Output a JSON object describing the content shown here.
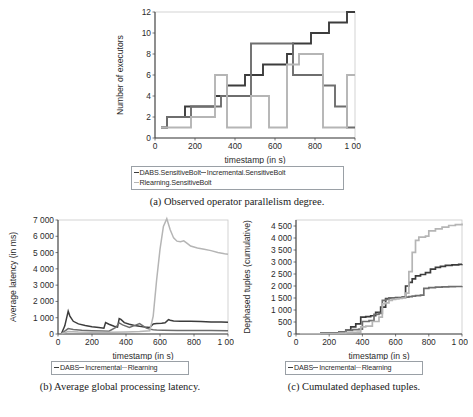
{
  "figure": {
    "panels": [
      {
        "id": "a",
        "caption": "(a) Observed operator parallelism degree.",
        "legend": [
          {
            "label": "DABS.SensitiveBolt",
            "color": "#3c3c3c"
          },
          {
            "label": "Incremental.SensitiveBolt",
            "color": "#6e6e6e"
          },
          {
            "label": "Rlearning.SensitiveBolt",
            "color": "#b5b5b5"
          }
        ]
      },
      {
        "id": "b",
        "caption": "(b) Average global processing latency.",
        "legend": [
          {
            "label": "DABS",
            "color": "#3c3c3c"
          },
          {
            "label": "Incremental",
            "color": "#6e6e6e"
          },
          {
            "label": "Rlearning",
            "color": "#b5b5b5"
          }
        ]
      },
      {
        "id": "c",
        "caption": "(c) Cumulated dephased tuples.",
        "legend": [
          {
            "label": "DABS",
            "color": "#3c3c3c"
          },
          {
            "label": "Incremental",
            "color": "#6e6e6e"
          },
          {
            "label": "Rlearning",
            "color": "#b5b5b5"
          }
        ]
      }
    ]
  },
  "chart_data": [
    {
      "id": "a",
      "type": "line",
      "title": "",
      "xlabel": "timestamp (in s)",
      "ylabel": "Number of executors",
      "xlim": [
        0,
        1000
      ],
      "ylim": [
        0,
        12
      ],
      "xticks": [
        0,
        200,
        400,
        600,
        800,
        1000
      ],
      "xticklabels": [
        "0",
        "200",
        "400",
        "600",
        "800",
        "1 000"
      ],
      "yticks": [
        0,
        2,
        4,
        6,
        8,
        10,
        12
      ],
      "yticklabels": [
        "0",
        "2",
        "4",
        "6",
        "8",
        "10",
        "12"
      ],
      "grid": false,
      "legend_position": "below",
      "step": true,
      "series": [
        {
          "name": "DABS.SensitiveBolt",
          "color": "#3c3c3c",
          "x": [
            30,
            60,
            120,
            150,
            270,
            300,
            330,
            360,
            420,
            450,
            480,
            540,
            600,
            660,
            690,
            720,
            750,
            780,
            810,
            840,
            870,
            900,
            930,
            960,
            990,
            1000
          ],
          "y": [
            1,
            2,
            2,
            3,
            3,
            4,
            4,
            5,
            5,
            6,
            6,
            7,
            7,
            8,
            9,
            9,
            9,
            10,
            10,
            10,
            11,
            11,
            11,
            12,
            12,
            12
          ]
        },
        {
          "name": "Incremental.SensitiveBolt",
          "color": "#6e6e6e",
          "x": [
            30,
            60,
            150,
            180,
            300,
            330,
            360,
            450,
            480,
            540,
            570,
            660,
            690,
            720,
            780,
            810,
            840,
            870,
            900,
            930,
            960,
            1000
          ],
          "y": [
            1,
            2,
            2,
            3,
            3,
            4,
            4,
            4,
            9,
            9,
            9,
            9,
            6,
            6,
            6,
            6,
            5,
            5,
            3,
            3,
            1,
            1
          ]
        },
        {
          "name": "Rlearning.SensitiveBolt",
          "color": "#b5b5b5",
          "x": [
            30,
            150,
            180,
            270,
            300,
            330,
            360,
            450,
            480,
            540,
            570,
            630,
            660,
            690,
            720,
            750,
            810,
            840,
            870,
            900,
            930,
            960,
            1000
          ],
          "y": [
            1,
            1,
            2,
            2,
            6,
            6,
            1,
            1,
            4,
            4,
            1,
            1,
            7,
            7,
            8,
            8,
            8,
            1,
            1,
            1,
            1,
            6,
            6
          ]
        }
      ]
    },
    {
      "id": "b",
      "type": "line",
      "title": "",
      "xlabel": "timestamp (in s)",
      "ylabel": "Average latency (in ms)",
      "xlim": [
        0,
        1000
      ],
      "ylim": [
        0,
        7000
      ],
      "xticks": [
        0,
        200,
        400,
        600,
        800,
        1000
      ],
      "xticklabels": [
        "0",
        "200",
        "400",
        "600",
        "800",
        "1 000"
      ],
      "yticks": [
        0,
        1000,
        2000,
        3000,
        4000,
        5000,
        6000,
        7000
      ],
      "yticklabels": [
        "0",
        "1 000",
        "2 000",
        "3 000",
        "4 000",
        "5 000",
        "6 000",
        "7 000"
      ],
      "grid": false,
      "legend_position": "below",
      "series": [
        {
          "name": "DABS",
          "color": "#3c3c3c",
          "x": [
            20,
            40,
            60,
            70,
            90,
            120,
            160,
            200,
            240,
            270,
            280,
            300,
            330,
            350,
            360,
            370,
            390,
            420,
            450,
            480,
            510,
            540,
            560,
            580,
            610,
            630,
            650,
            660,
            680,
            720,
            780,
            840,
            900,
            960,
            1000
          ],
          "y": [
            20,
            500,
            1400,
            1100,
            780,
            620,
            520,
            450,
            400,
            360,
            700,
            600,
            480,
            420,
            950,
            900,
            700,
            600,
            520,
            470,
            430,
            400,
            620,
            640,
            660,
            690,
            880,
            840,
            800,
            790,
            780,
            760,
            740,
            730,
            720
          ]
        },
        {
          "name": "Incremental",
          "color": "#6e6e6e",
          "x": [
            20,
            60,
            90,
            140,
            200,
            260,
            300,
            340,
            360,
            380,
            420,
            460,
            480,
            500,
            520,
            540,
            560,
            580,
            620,
            700,
            800,
            900,
            1000
          ],
          "y": [
            20,
            330,
            280,
            230,
            200,
            180,
            170,
            400,
            680,
            560,
            400,
            560,
            640,
            500,
            360,
            300,
            260,
            240,
            230,
            220,
            215,
            210,
            205
          ]
        },
        {
          "name": "Rlearning",
          "color": "#b5b5b5",
          "x": [
            20,
            60,
            120,
            200,
            300,
            400,
            480,
            540,
            560,
            580,
            600,
            620,
            640,
            660,
            680,
            700,
            720,
            740,
            760,
            780,
            820,
            860,
            900,
            940,
            980,
            1000
          ],
          "y": [
            20,
            150,
            120,
            110,
            110,
            130,
            160,
            200,
            1100,
            3300,
            5200,
            6600,
            7080,
            6400,
            5900,
            5700,
            5660,
            5720,
            5560,
            5400,
            5280,
            5200,
            5120,
            5000,
            4930,
            4900
          ]
        }
      ]
    },
    {
      "id": "c",
      "type": "line",
      "title": "",
      "xlabel": "timestamp (in s)",
      "ylabel": "Dephased tuples (cumulative)",
      "xlim": [
        0,
        1000
      ],
      "ylim": [
        0,
        4750
      ],
      "xticks": [
        0,
        200,
        400,
        600,
        800,
        1000
      ],
      "xticklabels": [
        "0",
        "200",
        "400",
        "600",
        "800",
        "1 000"
      ],
      "yticks": [
        0,
        500,
        1000,
        1500,
        2000,
        2500,
        3000,
        3500,
        4000,
        4500
      ],
      "yticklabels": [
        "0",
        "500",
        "1 000",
        "1 500",
        "2 000",
        "2 500",
        "3 000",
        "3 500",
        "4 000",
        "4 500"
      ],
      "grid": false,
      "legend_position": "below",
      "step": true,
      "series": [
        {
          "name": "DABS",
          "color": "#3c3c3c",
          "x": [
            20,
            150,
            260,
            300,
            330,
            360,
            390,
            420,
            450,
            480,
            510,
            540,
            560,
            600,
            640,
            660,
            680,
            700,
            720,
            750,
            780,
            810,
            840,
            870,
            900,
            940,
            980,
            1000
          ],
          "y": [
            10,
            40,
            90,
            160,
            300,
            420,
            700,
            720,
            760,
            900,
            1120,
            1480,
            1500,
            1520,
            1540,
            2000,
            2150,
            2300,
            2420,
            2480,
            2560,
            2700,
            2780,
            2820,
            2860,
            2880,
            2900,
            2910
          ]
        },
        {
          "name": "Incremental",
          "color": "#6e6e6e",
          "x": [
            20,
            150,
            260,
            300,
            340,
            380,
            400,
            440,
            470,
            500,
            520,
            540,
            560,
            600,
            640,
            660,
            680,
            700,
            720,
            750,
            770,
            800,
            840,
            880,
            920,
            960,
            1000
          ],
          "y": [
            10,
            40,
            90,
            150,
            180,
            200,
            520,
            560,
            820,
            860,
            1400,
            1440,
            1480,
            1500,
            1520,
            1540,
            1560,
            1580,
            1600,
            1620,
            1900,
            1930,
            1950,
            1960,
            1970,
            1980,
            1990
          ]
        },
        {
          "name": "Rlearning",
          "color": "#b5b5b5",
          "x": [
            20,
            150,
            260,
            300,
            340,
            370,
            390,
            420,
            460,
            500,
            520,
            540,
            560,
            580,
            600,
            620,
            640,
            660,
            680,
            700,
            720,
            740,
            780,
            800,
            840,
            880,
            920,
            960,
            1000
          ],
          "y": [
            5,
            20,
            40,
            60,
            70,
            80,
            300,
            330,
            520,
            700,
            1260,
            1300,
            1400,
            1440,
            1460,
            1480,
            1500,
            1700,
            2600,
            3400,
            3900,
            4040,
            4080,
            4300,
            4380,
            4450,
            4520,
            4560,
            4600
          ]
        }
      ]
    }
  ]
}
